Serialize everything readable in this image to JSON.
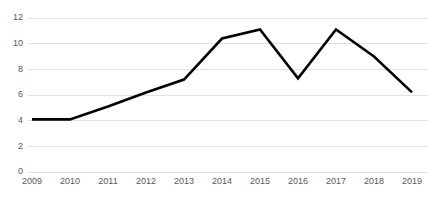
{
  "chart_data": {
    "type": "line",
    "title": "",
    "subtitle": "",
    "xlabel": "",
    "ylabel": "",
    "categories": [
      "2009",
      "2010",
      "2011",
      "2012",
      "2013",
      "2014",
      "2015",
      "2016",
      "2017",
      "2018",
      "2019"
    ],
    "series": [
      {
        "name": "",
        "values": [
          4.1,
          4.1,
          5.1,
          6.2,
          7.2,
          10.4,
          11.1,
          7.3,
          11.1,
          9.0,
          6.2
        ],
        "color": "#000000",
        "line_width": 2.6
      }
    ],
    "ylim": [
      0,
      12
    ],
    "y_ticks": [
      0,
      2,
      4,
      6,
      8,
      10,
      12
    ],
    "y_tick_labels": [
      "0",
      "2",
      "4",
      "6",
      "8",
      "10",
      "12"
    ],
    "x_tick_labels": [
      "2009",
      "2010",
      "2011",
      "2012",
      "2013",
      "2014",
      "2015",
      "2016",
      "2017",
      "2018",
      "2019"
    ],
    "grid": {
      "horizontal": true,
      "vertical": false,
      "color": "#d9d9d9"
    },
    "legend": {
      "visible": false,
      "position": "none",
      "entries": []
    },
    "markers": false,
    "axis_line_visible": false,
    "background_color": "#ffffff",
    "tick_label_color": "#595959"
  },
  "layout": {
    "width": 428,
    "height": 201,
    "plot_left": 32,
    "plot_right": 412,
    "plot_top": 18,
    "plot_bottom": 172,
    "x_label_y": 178
  }
}
